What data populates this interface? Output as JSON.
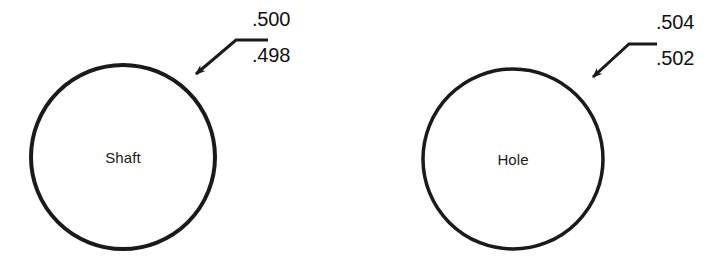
{
  "diagram": {
    "background_color": "#ffffff",
    "line_color": "#1a1a1a",
    "text_color": "#111111",
    "figures": [
      {
        "id": "shaft",
        "part_label": "Shaft",
        "circle": {
          "cx": 123,
          "cy": 157,
          "r": 92,
          "stroke_width": 4
        },
        "leader": {
          "arrow_tip_x": 191,
          "arrow_tip_y": 79,
          "elbow_x": 236,
          "elbow_y": 40,
          "end_x": 268,
          "end_y": 40,
          "stroke_width": 3
        },
        "dimensions": {
          "upper_limit": ".500",
          "lower_limit": ".498",
          "upper_x": 252,
          "upper_y": 8,
          "lower_x": 252,
          "lower_y": 44
        }
      },
      {
        "id": "hole",
        "part_label": "Hole",
        "circle": {
          "cx": 513,
          "cy": 159,
          "r": 90,
          "stroke_width": 3.5
        },
        "leader": {
          "arrow_tip_x": 588,
          "arrow_tip_y": 81,
          "elbow_x": 629,
          "elbow_y": 44,
          "end_x": 657,
          "end_y": 44,
          "stroke_width": 3
        },
        "dimensions": {
          "upper_limit": ".504",
          "lower_limit": ".502",
          "upper_x": 656,
          "upper_y": 11,
          "lower_x": 656,
          "lower_y": 47
        }
      }
    ]
  }
}
